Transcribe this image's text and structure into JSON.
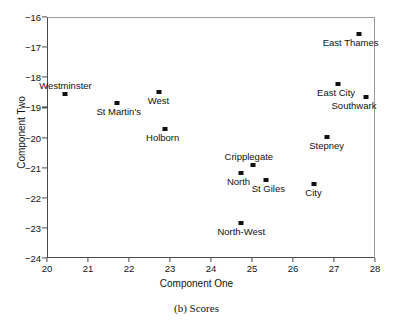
{
  "chart_data": {
    "type": "scatter",
    "title": "",
    "caption": "(b) Scores",
    "xlabel": "Component One",
    "ylabel": "Component Two",
    "xlim": [
      20,
      28
    ],
    "ylim": [
      -24,
      -16
    ],
    "xticks": [
      "20",
      "21",
      "22",
      "23",
      "24",
      "25",
      "26",
      "27",
      "28"
    ],
    "yticks": [
      "−16",
      "−17",
      "−18",
      "−19",
      "−20",
      "−21",
      "−22",
      "−23",
      "−24"
    ],
    "grid": false,
    "legend": "none",
    "marker_style": "filled-square",
    "marker_color": "#111111",
    "points": [
      {
        "label": "Westminster",
        "x": 20.45,
        "y": -18.55,
        "label_dx": 0,
        "label_dy": -13,
        "label_align": "center"
      },
      {
        "label": "St Martin's",
        "x": 21.7,
        "y": -18.87,
        "label_dx": 2,
        "label_dy": 4,
        "label_align": "center"
      },
      {
        "label": "West",
        "x": 22.72,
        "y": -18.49,
        "label_dx": 0,
        "label_dy": 4,
        "label_align": "center"
      },
      {
        "label": "Holborn",
        "x": 22.87,
        "y": -19.73,
        "label_dx": -2,
        "label_dy": 4,
        "label_align": "center"
      },
      {
        "label": "Cripplegate",
        "x": 25.02,
        "y": -20.91,
        "label_dx": -4,
        "label_dy": -13,
        "label_align": "center"
      },
      {
        "label": "North",
        "x": 24.72,
        "y": -21.17,
        "label_dx": -2,
        "label_dy": 4,
        "label_align": "center"
      },
      {
        "label": "St Giles",
        "x": 25.35,
        "y": -21.4,
        "label_dx": 2,
        "label_dy": 4,
        "label_align": "center"
      },
      {
        "label": "North-West",
        "x": 24.74,
        "y": -22.84,
        "label_dx": 0,
        "label_dy": 4,
        "label_align": "center"
      },
      {
        "label": "City",
        "x": 26.5,
        "y": -21.55,
        "label_dx": 0,
        "label_dy": 4,
        "label_align": "center"
      },
      {
        "label": "Stepney",
        "x": 26.82,
        "y": -19.98,
        "label_dx": 0,
        "label_dy": 4,
        "label_align": "center"
      },
      {
        "label": "East City",
        "x": 27.1,
        "y": -18.22,
        "label_dx": -2,
        "label_dy": 4,
        "label_align": "center"
      },
      {
        "label": "Southwark",
        "x": 27.78,
        "y": -18.67,
        "label_dx": -12,
        "label_dy": 4,
        "label_align": "center"
      },
      {
        "label": "East Thames",
        "x": 27.6,
        "y": -16.55,
        "label_dx": -8,
        "label_dy": 4,
        "label_align": "center"
      }
    ]
  }
}
